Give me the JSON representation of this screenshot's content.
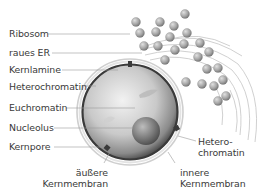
{
  "diagram": {
    "labels_left": [
      {
        "id": "ribosom",
        "text": "Ribosom"
      },
      {
        "id": "raues-er",
        "text": "raues ER"
      },
      {
        "id": "kernlamine",
        "text": "Kernlamine"
      },
      {
        "id": "heterochromatin",
        "text": "Heterochromatin"
      },
      {
        "id": "euchromatin",
        "text": "Euchromatin"
      },
      {
        "id": "nucleolus",
        "text": "Nucleolus"
      },
      {
        "id": "kernpore",
        "text": "Kernpore"
      }
    ],
    "labels_bottom": {
      "aeussere": {
        "line1": "äußere",
        "line2": "Kernmembran"
      },
      "innere": {
        "line1": "innere",
        "line2": "Kernmembran"
      }
    },
    "labels_right": {
      "heterochromatin": {
        "line1": "Hetero-",
        "line2": "chromatin"
      }
    },
    "colors": {
      "text": "#3a3a3a",
      "leader": "#9a9a9a",
      "nucleus_dark": "#4a4a4a",
      "nucleus_light": "#e8e8e8",
      "ribosome": "#9c9c9c",
      "er_membrane": "#bdbdbd"
    }
  }
}
